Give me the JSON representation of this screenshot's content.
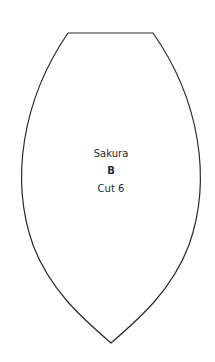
{
  "pattern_piece": {
    "name": "Sakura",
    "letter": "B",
    "cut_instruction": "Cut 6",
    "outline_color": "#2a2a2a",
    "background_color": "#ffffff"
  }
}
